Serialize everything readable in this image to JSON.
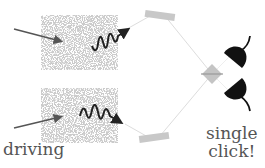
{
  "labels": {
    "driving": "driving",
    "single_click_line1": "single",
    "single_click_line2": "click!"
  },
  "colors": {
    "crystal_noise": "#9a9a9a",
    "mirror": "#c8c8c8",
    "beam": "#d8d8d8",
    "arrow": "#555555",
    "photon": "#222222",
    "detector": "#111111",
    "splitter": "#c4c4c4",
    "text": "#555555"
  },
  "elements": {
    "crystals": [
      "upper-crystal",
      "lower-crystal"
    ],
    "mirrors": [
      "upper-mirror",
      "lower-mirror"
    ],
    "detectors": [
      "upper-detector",
      "lower-detector"
    ],
    "beam_splitter": "beam-splitter"
  }
}
